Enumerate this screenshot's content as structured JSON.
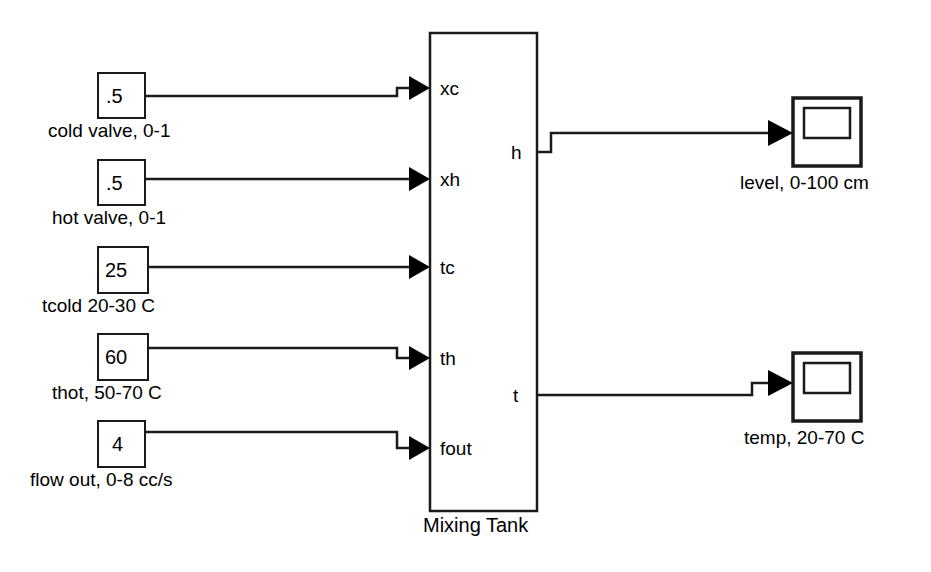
{
  "diagram": {
    "background_color": "#ffffff",
    "line_color": "#1a1a1a",
    "text_color": "#000000"
  },
  "constants": [
    {
      "id": "cold-valve",
      "value": ".5",
      "caption": "cold valve, 0-1"
    },
    {
      "id": "hot-valve",
      "value": ".5",
      "caption": "hot valve, 0-1"
    },
    {
      "id": "tcold",
      "value": "25",
      "caption": "tcold 20-30 C"
    },
    {
      "id": "thot",
      "value": "60",
      "caption": "thot, 50-70 C"
    },
    {
      "id": "flow-out",
      "value": "4",
      "caption": "flow out, 0-8 cc/s"
    }
  ],
  "tank": {
    "caption": "Mixing Tank",
    "input_ports": [
      "xc",
      "xh",
      "tc",
      "th",
      "fout"
    ],
    "output_ports": [
      "h",
      "t"
    ]
  },
  "scopes": [
    {
      "id": "level-scope",
      "caption": "level, 0-100 cm"
    },
    {
      "id": "temp-scope",
      "caption": "temp, 20-70 C"
    }
  ]
}
